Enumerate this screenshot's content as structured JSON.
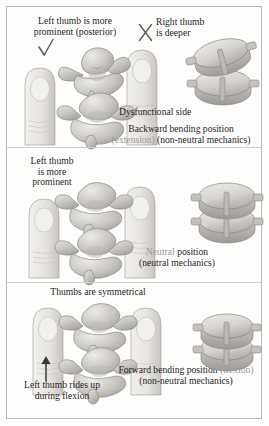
{
  "figure": {
    "panels": [
      {
        "id": "extension",
        "labels": {
          "left_finding": "Left thumb is more\nprominent (posterior)",
          "left_finding_line1": "Left thumb is more",
          "left_finding_line2": "prominent (posterior)",
          "left_mark": "✓",
          "right_mark": "X",
          "right_finding_line1": "Right thumb",
          "right_finding_line2": "is deeper",
          "callout": "Dysfunctional side",
          "position_name": "Backward bending position",
          "position_qualifier_light": "(extension)",
          "position_qualifier_dark": "(non-neutral mechanics)"
        }
      },
      {
        "id": "neutral",
        "labels": {
          "left_finding_line1": "Left thumb",
          "left_finding_line2": "is more",
          "left_finding_line3": "prominent",
          "position_name_light": "Neutral",
          "position_name_dark": "position",
          "position_qualifier": "(neutral mechanics)"
        }
      },
      {
        "id": "flexion",
        "labels": {
          "top_finding": "Thumbs are symmetrical",
          "bottom_finding_line1": "Left thumb rides up",
          "bottom_finding_line2": "during flexion",
          "position_name_dark": "Forward bending position",
          "position_name_light": "(flexion)",
          "position_qualifier": "(non-neutral mechanics)"
        }
      }
    ],
    "icons": {
      "check": "check-mark",
      "cross": "x-mark",
      "arrow": "up-arrow"
    },
    "colors": {
      "ink_dark": "#262626",
      "ink_light": "#9a9a9a",
      "border": "#b9b9b9",
      "bone_fill": "#d9d7d4",
      "bone_shade": "#b3b0ac",
      "skin_fill": "#eceae7",
      "background": "#fdfdfc"
    }
  }
}
